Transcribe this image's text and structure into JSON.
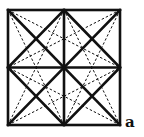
{
  "diagram": {
    "label": "a",
    "colors": {
      "stroke": "#111111",
      "background": "#ffffff"
    },
    "square": {
      "x0": 8,
      "y0": 10,
      "x1": 120,
      "y1": 125
    },
    "bold_lines": [
      "outer-square",
      "vertical-midline",
      "horizontal-midline",
      "main-diagonal-tl-br",
      "main-diagonal-tr-bl",
      "diamond-top-right",
      "diamond-right-bottom",
      "diamond-bottom-left",
      "diamond-left-top"
    ],
    "dashed_lines": [
      "tl-to-right-mid",
      "tl-to-bottom-mid",
      "tr-to-left-mid",
      "tr-to-bottom-mid",
      "bl-to-top-mid",
      "bl-to-right-mid",
      "br-to-top-mid",
      "br-to-left-mid"
    ]
  }
}
